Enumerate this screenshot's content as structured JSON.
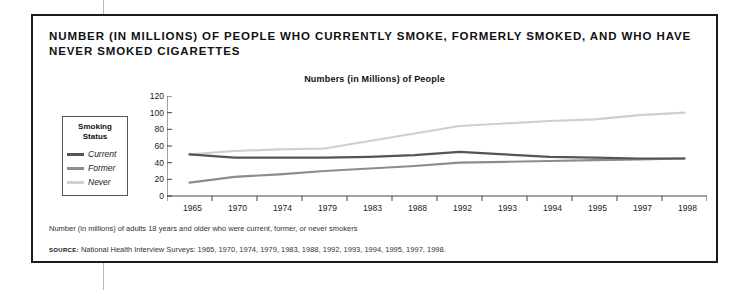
{
  "card": {
    "title": "NUMBER (IN MILLIONS) OF PEOPLE WHO CURRENTLY SMOKE, FORMERLY SMOKED, AND WHO HAVE NEVER SMOKED CIGARETTES",
    "footnote": "Number (in millions) of adults 18 years and older who were current, former, or never smokers",
    "source_kicker": "SOURCE:",
    "source_text": "National Health Interview Surveys: 1965, 1970, 1974, 1979, 1983, 1988, 1992, 1993, 1994, 1995, 1997, 1998."
  },
  "legend": {
    "title_line1": "Smoking",
    "title_line2": "Status",
    "items": [
      {
        "label": "Current",
        "color": "#555555"
      },
      {
        "label": "Former",
        "color": "#8c8c8c"
      },
      {
        "label": "Never",
        "color": "#cfcfcf"
      }
    ]
  },
  "chart_data": {
    "type": "line",
    "title": "Numbers (in Millions) of People",
    "subtitle": "",
    "xlabel": "",
    "ylabel": "",
    "ylim": [
      0,
      120
    ],
    "yticks": [
      0,
      20,
      40,
      60,
      80,
      100,
      120
    ],
    "grid": false,
    "legend_position": "left-outside",
    "categories": [
      "1965",
      "1970",
      "1974",
      "1979",
      "1983",
      "1988",
      "1992",
      "1993",
      "1994",
      "1995",
      "1997",
      "1998"
    ],
    "series": [
      {
        "name": "Current",
        "color": "#555555",
        "values": [
          50,
          46,
          46,
          46,
          47,
          49,
          53,
          50,
          47,
          46,
          45,
          45
        ]
      },
      {
        "name": "Former",
        "color": "#8c8c8c",
        "values": [
          16,
          23,
          26,
          30,
          33,
          36,
          40,
          41,
          42,
          43,
          44,
          45
        ]
      },
      {
        "name": "Never",
        "color": "#cfcfcf",
        "values": [
          50,
          54,
          56,
          57,
          66,
          75,
          84,
          87,
          90,
          92,
          97,
          100
        ]
      }
    ]
  }
}
